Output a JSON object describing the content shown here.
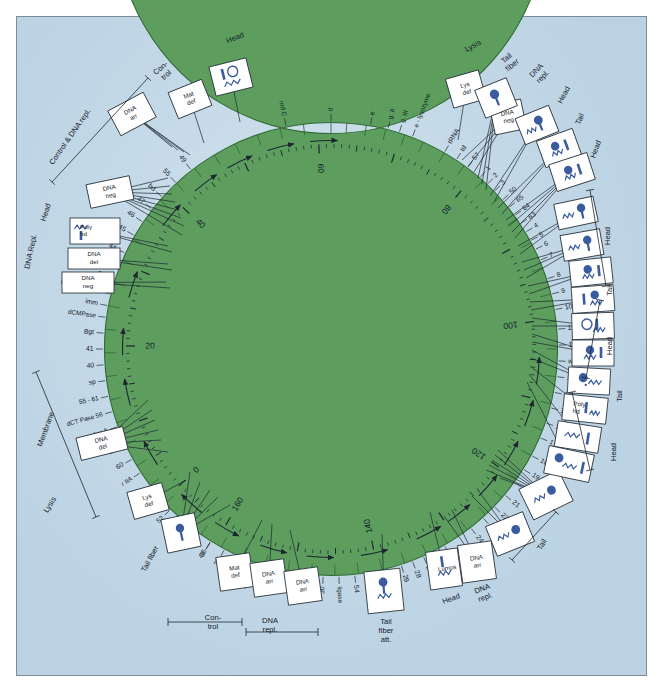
{
  "figure": {
    "kind": "circular-genetic-map",
    "organism_map": "bacteriophage T4 circular genetic map",
    "colors": {
      "background": "#c3d9e8",
      "genome_ring": "#5d9e5f",
      "ring_outline": "#2f6b33",
      "ink": "#1d2730",
      "phage_icon": "#3a5ba0",
      "box_fill": "#ffffff",
      "frame_border": "#7d8c96"
    }
  },
  "scale": {
    "unit_note": "map units",
    "ticks": [
      "0",
      "20",
      "40",
      "60",
      "80",
      "100",
      "120",
      "140",
      "160"
    ],
    "values": [
      0,
      20,
      40,
      60,
      80,
      100,
      120,
      140,
      160
    ]
  },
  "genes": {
    "note": "gene/locus labels placed radially around the green genome ring, clockwise from top",
    "clockwise_from_top": [
      "rI",
      "e",
      "g. II",
      "g. III",
      "e - lysozyme",
      "tRNA",
      "td",
      "57",
      "1",
      "2",
      "3",
      "50",
      "65",
      "64",
      "63",
      "4",
      "5",
      "6",
      "7",
      "8",
      "9",
      "10",
      "11",
      "12",
      "wac",
      "13",
      "14",
      "15",
      "16",
      "17",
      "18",
      "19",
      "20",
      "21",
      "22",
      "23",
      "24",
      "25",
      "26",
      "27",
      "28",
      "29",
      "51",
      "52",
      "48",
      "54",
      "ligase",
      "30",
      "31",
      "rII",
      "32",
      "59",
      "33",
      "34",
      "35",
      "36",
      "37",
      "38",
      "52",
      "ac",
      "r IIB",
      "r IIA",
      "60",
      "39",
      "dex A",
      "dCT Pase 56",
      "55 - 61",
      "sp",
      "40",
      "41",
      "Bgt",
      "dCMPase",
      "imm",
      "DNA polym 43",
      "62",
      "sp",
      "44",
      "45",
      "46",
      "47",
      "bd",
      "55",
      "49",
      "nrd C"
    ],
    "lower_arc": [
      "dfp",
      "td",
      "nrd A",
      "nrd B",
      "den A",
      "43"
    ]
  },
  "phenotype_boxes": [
    {
      "id": "box-dna-arr-top",
      "label": "DNA arr",
      "leaders": [
        "46",
        "47",
        "bd",
        "55"
      ]
    },
    {
      "id": "box-mat-def-top",
      "label": "Mat def",
      "leaders": [
        "55"
      ]
    },
    {
      "id": "box-head-icon-top",
      "label": "",
      "leaders": [
        "49"
      ]
    },
    {
      "id": "box-dna-neg-upper",
      "label": "DNA neg",
      "leaders": [
        "45",
        "44",
        "62",
        "sp",
        "62",
        "DNA polym 43",
        "imm",
        "dCMPase"
      ]
    },
    {
      "id": "box-poly-hd",
      "label": "Poly hd",
      "leaders": [
        "Bgt",
        "41"
      ]
    },
    {
      "id": "box-dna-del-left",
      "label": "DNA del",
      "leaders": [
        "40",
        "sp"
      ]
    },
    {
      "id": "box-dna-neg-lower-left",
      "label": "DNA neg",
      "leaders": [
        "55 - 61",
        "dCT Pase 56"
      ]
    },
    {
      "id": "box-dna-del-membrane",
      "label": "DNA del",
      "leaders": [
        "39",
        "60",
        "r IIA",
        "r IIB",
        "ac",
        "52"
      ]
    },
    {
      "id": "box-lys-def-bottom",
      "label": "Lys def",
      "leaders": [
        "38"
      ]
    },
    {
      "id": "box-tail-fiber-bottom",
      "label": "",
      "leaders": [
        "38",
        "37",
        "36",
        "35",
        "34"
      ]
    },
    {
      "id": "box-mat-def-bottom",
      "label": "Mat def",
      "leaders": [
        "33"
      ]
    },
    {
      "id": "box-dna-arr-b1",
      "label": "DNA arr",
      "leaders": [
        "59"
      ]
    },
    {
      "id": "box-dna-arr-b2",
      "label": "DNA arr",
      "leaders": [
        "32"
      ]
    },
    {
      "id": "box-tail-fiber-att",
      "label": "",
      "leaders": [
        "43"
      ]
    },
    {
      "id": "box-lumps",
      "label": "Lumps",
      "leaders": [
        "31"
      ]
    },
    {
      "id": "box-dna-arr-br",
      "label": "DNA arr",
      "leaders": [
        "30",
        "ligase"
      ]
    },
    {
      "id": "box-tail-br1",
      "label": "",
      "leaders": [
        "54",
        "48"
      ]
    },
    {
      "id": "box-tail-br2",
      "label": "",
      "leaders": [
        "25",
        "26",
        "27",
        "28",
        "29",
        "51",
        "52"
      ]
    },
    {
      "id": "box-lys-def-top",
      "label": "Lys def",
      "leaders": [
        "e - lysozyme"
      ]
    },
    {
      "id": "box-dna-neg-top-right",
      "label": "DNA neg",
      "leaders": [
        "tRNA",
        "td",
        "57"
      ]
    },
    {
      "id": "box-head-r1",
      "label": "",
      "leaders": [
        "1",
        "2",
        "3"
      ]
    },
    {
      "id": "box-head-r2",
      "label": "",
      "leaders": [
        "50",
        "65"
      ]
    },
    {
      "id": "box-head-r3",
      "label": "",
      "leaders": [
        "64",
        "63"
      ]
    },
    {
      "id": "box-tail-r4",
      "label": "",
      "leaders": [
        "4",
        "5",
        "6",
        "7"
      ]
    },
    {
      "id": "box-tail-r5",
      "label": "",
      "leaders": [
        "8",
        "9"
      ]
    },
    {
      "id": "box-tail-r6",
      "label": "",
      "leaders": [
        "10",
        "11",
        "12"
      ]
    },
    {
      "id": "box-head-r7",
      "label": "",
      "leaders": [
        "wac",
        "13"
      ]
    },
    {
      "id": "box-tail-r8",
      "label": "",
      "leaders": [
        "14",
        "15"
      ]
    },
    {
      "id": "box-head-r9",
      "label": "",
      "leaders": [
        "16",
        "17"
      ]
    },
    {
      "id": "box-tail-r10",
      "label": "",
      "leaders": [
        "18",
        "19"
      ]
    },
    {
      "id": "box-head-r11",
      "label": "",
      "leaders": [
        "20",
        "21"
      ]
    },
    {
      "id": "box-poly-hd-r12",
      "label": "Poly hd",
      "leaders": [
        "22"
      ]
    },
    {
      "id": "box-head-r13",
      "label": "",
      "leaders": [
        "23"
      ]
    },
    {
      "id": "box-head-r14",
      "label": "",
      "leaders": [
        "24"
      ]
    }
  ],
  "group_annotations": [
    {
      "id": "grp-control-top",
      "text": "Con-\ntrol",
      "lines": [
        "Con-",
        "trol"
      ]
    },
    {
      "id": "grp-head-top",
      "text": "Head"
    },
    {
      "id": "grp-control-dna-repl",
      "text": "Control & DNA repl."
    },
    {
      "id": "grp-dna-repl-left",
      "text": "DNA Repl."
    },
    {
      "id": "grp-head-left",
      "text": "Head"
    },
    {
      "id": "grp-membrane",
      "text": "Membrane"
    },
    {
      "id": "grp-lysis-left",
      "text": "Lysis"
    },
    {
      "id": "grp-tail-fiber-left",
      "text": "Tail fiber"
    },
    {
      "id": "grp-control-bottom",
      "text": "Con-\ntrol",
      "lines": [
        "Con-",
        "trol"
      ]
    },
    {
      "id": "grp-dna-repl-bottom",
      "text": "DNA repl.",
      "lines": [
        "DNA",
        "repl."
      ]
    },
    {
      "id": "grp-tail-fiber-att",
      "text": "Tail fiber att.",
      "lines": [
        "Tail",
        "fiber",
        "att."
      ]
    },
    {
      "id": "grp-head-bottom",
      "text": "Head"
    },
    {
      "id": "grp-dna-repl-br",
      "text": "DNA repl.",
      "lines": [
        "DNA",
        "repl."
      ]
    },
    {
      "id": "grp-tail-br",
      "text": "Tail"
    },
    {
      "id": "grp-head-r-a",
      "text": "Head"
    },
    {
      "id": "grp-tail-r-a",
      "text": "Tail"
    },
    {
      "id": "grp-head-r-b",
      "text": "Head"
    },
    {
      "id": "grp-tail-r-b",
      "text": "Tail"
    },
    {
      "id": "grp-head-r-c",
      "text": "Head"
    },
    {
      "id": "grp-lysis-top",
      "text": "Lysis"
    },
    {
      "id": "grp-tail-fiber-top",
      "text": "Tail fiber",
      "lines": [
        "Tail",
        "fiber"
      ]
    },
    {
      "id": "grp-dna-repl-top",
      "text": "DNA repl.",
      "lines": [
        "DNA",
        "repl."
      ]
    },
    {
      "id": "grp-head-tr",
      "text": "Head"
    },
    {
      "id": "grp-tail-tr",
      "text": "Tail"
    },
    {
      "id": "grp-head-tr2",
      "text": "Head"
    }
  ]
}
